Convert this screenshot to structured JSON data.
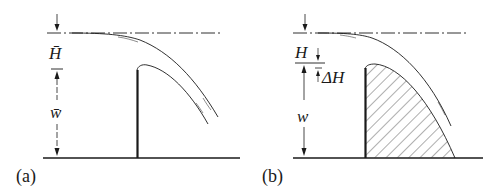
{
  "figure": {
    "panels": [
      {
        "id": "a",
        "label": "(a)",
        "head_label": "H̄",
        "height_label": "w̄",
        "description": "Sharp-crested weir with free nappe"
      },
      {
        "id": "b",
        "label": "(b)",
        "head_label": "H",
        "delta_label": "ΔH",
        "height_label": "w",
        "description": "Equivalent solid weir shaped as lower nappe (hatched)"
      }
    ],
    "colors": {
      "line": "#1a1a1a",
      "background": "#ffffff"
    }
  }
}
